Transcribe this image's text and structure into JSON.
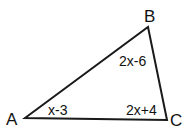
{
  "diagram": {
    "type": "triangle",
    "vertices": [
      {
        "name": "A",
        "x": 25,
        "y": 118
      },
      {
        "name": "B",
        "x": 148,
        "y": 27
      },
      {
        "name": "C",
        "x": 167,
        "y": 120
      }
    ],
    "angle_labels": {
      "A": "x-3",
      "B": "2x-6",
      "C": "2x+4"
    },
    "stroke_color": "#1a1a1a"
  }
}
